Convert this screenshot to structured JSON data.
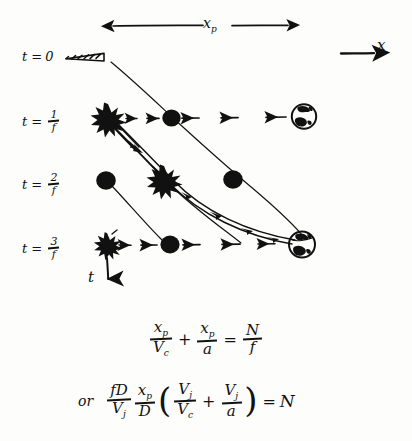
{
  "figure": {
    "background_color": "#fdfdfc",
    "ink_color": "#111111"
  },
  "top_axis": {
    "span_label": "x",
    "span_label_sub": "p",
    "arrow_style": "double-headed",
    "x_axis_label": "x",
    "x_axis_arrow": "right"
  },
  "time_axis": {
    "label": "t",
    "arrow": "down",
    "rows": [
      {
        "id": "row0",
        "prefix": "t =",
        "value": "0",
        "is_fraction": false,
        "numerator": "",
        "denominator": ""
      },
      {
        "id": "row1",
        "prefix": "t =",
        "value": "",
        "is_fraction": true,
        "numerator": "1",
        "denominator": "f"
      },
      {
        "id": "row2",
        "prefix": "t =",
        "value": "",
        "is_fraction": true,
        "numerator": "2",
        "denominator": "f"
      },
      {
        "id": "row3",
        "prefix": "t =",
        "value": "",
        "is_fraction": true,
        "numerator": "3",
        "denominator": "f"
      }
    ]
  },
  "glyphs": {
    "emitter_cone": "hatched-cone-icon",
    "pulse_blob": "filled-circle-icon",
    "burst": "starburst-icon",
    "earth": "earth-globe-icon",
    "signal_arrow": "left-arrow-icon",
    "light_path": "curved-double-line"
  },
  "equations": [
    {
      "id": "eq1",
      "prefix": "",
      "terms": [
        {
          "type": "fraction",
          "num": "x",
          "num_sub": "p",
          "den": "V",
          "den_sub": "c"
        },
        {
          "type": "op",
          "text": "+"
        },
        {
          "type": "fraction",
          "num": "x",
          "num_sub": "p",
          "den": "a",
          "den_sub": ""
        },
        {
          "type": "op",
          "text": "="
        },
        {
          "type": "fraction",
          "num": "N",
          "num_sub": "",
          "den": "f",
          "den_sub": ""
        }
      ]
    },
    {
      "id": "eq2",
      "prefix": "or",
      "terms": [
        {
          "type": "fraction",
          "num": "fD",
          "num_sub": "",
          "den": "V",
          "den_sub": "j"
        },
        {
          "type": "fraction",
          "num": "x",
          "num_sub": "p",
          "den": "D",
          "den_sub": ""
        },
        {
          "type": "paren",
          "text": "("
        },
        {
          "type": "fraction",
          "num": "V",
          "num_sub": "j",
          "den": "V",
          "den_sub": "c"
        },
        {
          "type": "op",
          "text": "+"
        },
        {
          "type": "fraction",
          "num": "V",
          "num_sub": "j",
          "den": "a",
          "den_sub": ""
        },
        {
          "type": "paren",
          "text": ")"
        },
        {
          "type": "op",
          "text": "="
        },
        {
          "type": "symbol",
          "text": "N"
        }
      ]
    }
  ]
}
